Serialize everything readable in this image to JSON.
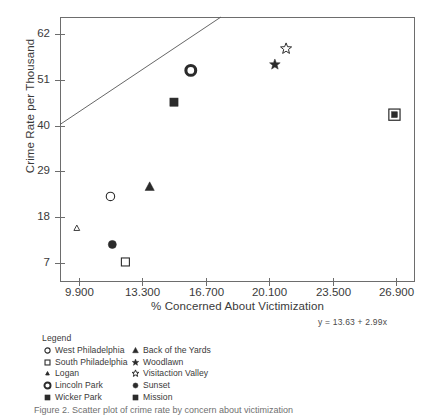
{
  "chart_data": {
    "type": "scatter",
    "title": "",
    "xlabel": "% Concerned About Victimization",
    "ylabel": "Crime Rate per Thousand",
    "xlim": [
      8.9,
      27.9
    ],
    "ylim": [
      2.5,
      66.0
    ],
    "xticks": [
      "9.900",
      "13.300",
      "16.700",
      "20.100",
      "23.500",
      "26.900"
    ],
    "xtick_values": [
      9.9,
      13.3,
      16.7,
      20.1,
      23.5,
      26.9
    ],
    "yticks": [
      "7",
      "18",
      "29",
      "40",
      "51",
      "62"
    ],
    "ytick_values": [
      7,
      18,
      29,
      40,
      51,
      62
    ],
    "grid": false,
    "legend_position": "below-plot-left",
    "trendline": {
      "equation": "y = 13.63 + 2.99x",
      "intercept": 13.63,
      "slope": 2.99
    },
    "points": [
      {
        "name": "West Philadelphia",
        "marker": "open-circle",
        "x": 11.6,
        "y": 23.0
      },
      {
        "name": "South Philadelphia",
        "marker": "open-square",
        "x": 12.4,
        "y": 7.3
      },
      {
        "name": "Logan",
        "marker": "small-open-triangle",
        "x": 9.8,
        "y": 15.4
      },
      {
        "name": "Lincoln Park",
        "marker": "ring-circle",
        "x": 15.9,
        "y": 53.2
      },
      {
        "name": "Wicker Park",
        "marker": "filled-square",
        "x": 15.0,
        "y": 45.6
      },
      {
        "name": "Back of the Yards",
        "marker": "filled-triangle",
        "x": 13.7,
        "y": 25.3
      },
      {
        "name": "Woodlawn",
        "marker": "filled-star",
        "x": 20.4,
        "y": 54.6
      },
      {
        "name": "Visitaction Valley",
        "marker": "open-star",
        "x": 21.0,
        "y": 58.4
      },
      {
        "name": "Sunset",
        "marker": "filled-circle",
        "x": 11.7,
        "y": 11.5
      },
      {
        "name": "Mission",
        "marker": "boxed-filled-square",
        "x": 26.8,
        "y": 42.6
      }
    ]
  },
  "legend": {
    "title": "Legend",
    "column_left": [
      {
        "label": "West Philadelphia",
        "marker": "open-circle"
      },
      {
        "label": "South Philadelphia",
        "marker": "open-square"
      },
      {
        "label": "Logan",
        "marker": "small-filled-triangle"
      },
      {
        "label": "Lincoln Park",
        "marker": "ring-circle"
      },
      {
        "label": "Wicker Park",
        "marker": "filled-square"
      }
    ],
    "column_right": [
      {
        "label": "Back of the Yards",
        "marker": "filled-triangle"
      },
      {
        "label": "Woodlawn",
        "marker": "filled-star"
      },
      {
        "label": "Visitaction Valley",
        "marker": "open-star"
      },
      {
        "label": "Sunset",
        "marker": "filled-circle"
      },
      {
        "label": "Mission",
        "marker": "filled-square"
      }
    ]
  },
  "annotations": {
    "equation": "y = 13.63 + 2.99x"
  },
  "caption": "Figure 2.  Scatter plot of crime rate by concern about victimization",
  "colors": {
    "marker": "#2b2b2b",
    "axis": "#6d6d6d",
    "text": "#3a3a3a",
    "trendline": "#555555",
    "background": "#ffffff"
  }
}
